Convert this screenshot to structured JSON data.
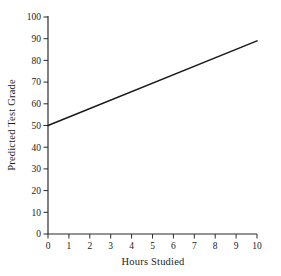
{
  "chart_data": {
    "type": "line",
    "title": "",
    "xlabel": "Hours Studied",
    "ylabel": "Predicted Test Grade",
    "xlim": [
      0,
      10
    ],
    "ylim": [
      0,
      100
    ],
    "xticks": [
      0,
      1,
      2,
      3,
      4,
      5,
      6,
      7,
      8,
      9,
      10
    ],
    "yticks": [
      0,
      10,
      20,
      30,
      40,
      50,
      60,
      70,
      80,
      90,
      100
    ],
    "grid": false,
    "legend_position": "none",
    "series": [
      {
        "name": "predicted-grade-regression-line",
        "x": [
          0,
          10
        ],
        "y": [
          50,
          89
        ],
        "color": "#1a1a1a"
      }
    ],
    "colors": {
      "axis": "#2b2b2b",
      "tick_text": "#1c1c1c",
      "background": "#ffffff"
    }
  }
}
